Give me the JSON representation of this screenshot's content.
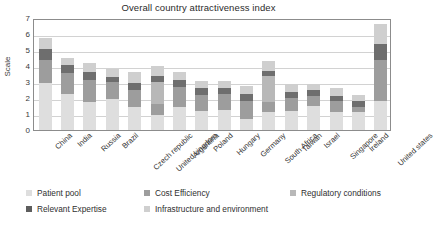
{
  "chart_data": {
    "type": "bar",
    "subtype": "stacked-column",
    "title": "Overall country attractiveness index",
    "xlabel": "",
    "ylabel": "Scale",
    "ylim": [
      0,
      7
    ],
    "yticks": [
      0,
      1,
      2,
      3,
      4,
      5,
      6,
      7
    ],
    "grid": true,
    "legend_position": "bottom",
    "categories": [
      "China",
      "India",
      "Russia",
      "Brazil",
      "Czech republic",
      "United kingdom",
      "Argentina",
      "Poland",
      "Hungary",
      "Germany",
      "South Africa",
      "Taiwan",
      "Israel",
      "Singapore",
      "Ireland",
      "United states"
    ],
    "series": [
      {
        "name": "Patient pool",
        "color": "#dedede",
        "values": [
          2.95,
          2.25,
          1.75,
          1.95,
          1.45,
          0.95,
          1.45,
          1.2,
          1.25,
          0.7,
          1.1,
          1.2,
          1.5,
          1.15,
          1.1,
          1.8
        ]
      },
      {
        "name": "Cost Efficiency",
        "color": "#9d9d9d",
        "values": [
          1.45,
          1.3,
          1.4,
          1.05,
          1.05,
          0.65,
          1.25,
          1.0,
          1.0,
          1.1,
          0.65,
          0.8,
          0.6,
          0.65,
          0.35,
          2.6
        ]
      },
      {
        "name": "Regulatory conditions",
        "color": "#b8b8b8",
        "values": [
          0.0,
          0.0,
          0.0,
          0.0,
          0.0,
          1.4,
          0.0,
          0.0,
          0.0,
          0.0,
          1.6,
          0.0,
          0.0,
          0.0,
          0.0,
          0.0
        ]
      },
      {
        "name": "Relevant Expertise",
        "color": "#6e6e6e",
        "values": [
          0.65,
          0.5,
          0.5,
          0.3,
          0.45,
          0.4,
          0.4,
          0.4,
          0.4,
          0.45,
          0.35,
          0.4,
          0.4,
          0.35,
          0.35,
          1.0
        ]
      },
      {
        "name": "Infrastructure and environment",
        "color": "#cfcfcf",
        "values": [
          0.7,
          0.45,
          0.55,
          0.5,
          0.65,
          0.6,
          0.55,
          0.45,
          0.4,
          0.5,
          0.6,
          0.45,
          0.4,
          0.45,
          0.4,
          1.2
        ]
      }
    ],
    "totals": [
      5.75,
      4.5,
      4.2,
      3.8,
      3.6,
      4.0,
      3.65,
      3.05,
      3.05,
      2.75,
      4.3,
      2.85,
      2.9,
      2.6,
      2.2,
      6.6
    ]
  },
  "legend": {
    "items": [
      {
        "label": "Patient pool",
        "color": "#dedede"
      },
      {
        "label": "Cost Efficiency",
        "color": "#9d9d9d"
      },
      {
        "label": "Regulatory conditions",
        "color": "#b8b8b8"
      },
      {
        "label": "Relevant Expertise",
        "color": "#5d5d5d"
      },
      {
        "label": "Infrastructure and environment",
        "color": "#cfcfcf"
      }
    ]
  },
  "axis": {
    "y_tick_labels": [
      "7",
      "6",
      "5",
      "4",
      "3",
      "2",
      "1",
      "0"
    ]
  }
}
